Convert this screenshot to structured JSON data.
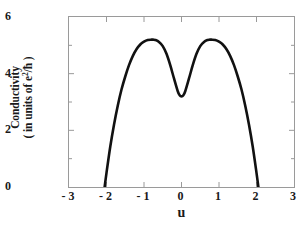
{
  "chart_data": {
    "type": "line",
    "title": "",
    "xlabel": "u",
    "ylabel_line1": "Conductivity",
    "ylabel_line2_prefix": "( in units of e",
    "ylabel_line2_sup": "2",
    "ylabel_line2_suffix": "/ħ )",
    "ylabel_plain": "Conductivity ( in units of e2/ħ )",
    "xlim": [
      -3,
      3
    ],
    "ylim": [
      0,
      6
    ],
    "xticks": [
      -3,
      -2,
      -1,
      0,
      1,
      2,
      3
    ],
    "xtick_labels": [
      "- 3",
      "- 2",
      "- 1",
      "0",
      "1",
      "2",
      "3"
    ],
    "yticks": [
      0,
      2,
      4,
      6
    ],
    "ytick_labels": [
      "0",
      "2",
      "4",
      "6"
    ],
    "xminor_step": 1,
    "yminor_ticks": [
      1,
      3,
      5
    ],
    "grid": false,
    "legend": null,
    "line_color": "#111111",
    "line_width": 2.6,
    "frame_color": "#9a9a9a",
    "peak_left": {
      "x": -0.75,
      "y": 5.2
    },
    "peak_right": {
      "x": 0.75,
      "y": 5.2
    },
    "center_dip": {
      "x": 0.0,
      "y": 3.2
    },
    "zero_crossings": [
      -2.05,
      2.05
    ],
    "series": [
      {
        "name": "conductivity",
        "x": [
          -2.05,
          -2.0,
          -1.9,
          -1.8,
          -1.7,
          -1.6,
          -1.5,
          -1.4,
          -1.3,
          -1.2,
          -1.1,
          -1.0,
          -0.9,
          -0.8,
          -0.75,
          -0.7,
          -0.6,
          -0.5,
          -0.4,
          -0.3,
          -0.2,
          -0.1,
          -0.05,
          0.0,
          0.05,
          0.1,
          0.2,
          0.3,
          0.4,
          0.5,
          0.6,
          0.7,
          0.75,
          0.8,
          0.9,
          1.0,
          1.1,
          1.2,
          1.3,
          1.4,
          1.5,
          1.6,
          1.7,
          1.8,
          1.9,
          2.0,
          2.05
        ],
        "y": [
          0.0,
          0.5,
          1.42,
          2.2,
          2.87,
          3.44,
          3.9,
          4.3,
          4.62,
          4.86,
          5.03,
          5.13,
          5.19,
          5.2,
          5.2,
          5.19,
          5.12,
          4.97,
          4.7,
          4.3,
          3.83,
          3.38,
          3.24,
          3.2,
          3.24,
          3.38,
          3.83,
          4.3,
          4.7,
          4.97,
          5.12,
          5.19,
          5.2,
          5.2,
          5.19,
          5.13,
          5.03,
          4.86,
          4.62,
          4.3,
          3.9,
          3.44,
          2.87,
          2.2,
          1.42,
          0.5,
          0.0
        ]
      }
    ]
  }
}
